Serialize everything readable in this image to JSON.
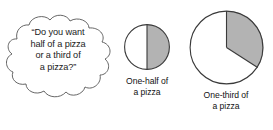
{
  "canvas": {
    "width": 273,
    "height": 130,
    "background": "#ffffff"
  },
  "colors": {
    "stroke": "#3a3a3a",
    "cloud_stroke": "#555555",
    "shaded_fill": "#b3b3b3",
    "unshaded_fill": "#ffffff",
    "text": "#121212"
  },
  "speech_bubble": {
    "shape": "cloud-callout",
    "lines": [
      "“Do you want",
      "half of a pizza",
      "or a third of",
      "a pizza?”"
    ],
    "full_text": "“Do you want half of a pizza or a third of a pizza?”"
  },
  "figures": [
    {
      "id": "half",
      "diagram": "circle-with-shaded-half",
      "fraction": "1/2",
      "shaded_degrees": 180,
      "shaded_side": "right",
      "caption_lines": [
        "One-half of",
        "a pizza"
      ],
      "caption_full": "One-half of a pizza",
      "diameter_px": 45
    },
    {
      "id": "third",
      "diagram": "circle-with-shaded-third",
      "fraction": "1/3",
      "shaded_degrees": 120,
      "shaded_start_clock": "12 o'clock",
      "shaded_direction": "clockwise",
      "caption_lines": [
        "One-third of",
        "a pizza"
      ],
      "caption_full": "One-third of a pizza",
      "diameter_px": 72
    }
  ]
}
